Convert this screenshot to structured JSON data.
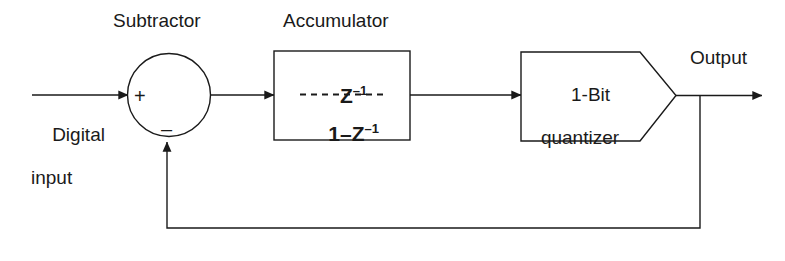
{
  "diagram": {
    "background_color": "#ffffff",
    "line_color": "#1a1a1a",
    "labels": {
      "subtractor": "Subtractor",
      "accumulator": "Accumulator",
      "digital_input_line1": "Digital",
      "digital_input_line2": "input",
      "output": "Output",
      "quantizer_line1": "1-Bit",
      "quantizer_line2": "quantizer",
      "plus_sign": "+",
      "minus_sign": "–"
    },
    "accumulator_transfer_function": {
      "numerator_base": "Z",
      "numerator_exponent": "–1",
      "denominator_base": "1–Z",
      "denominator_exponent": "–1",
      "fraction_bar_style": "dashed",
      "expression": "Z^-1 / (1 - Z^-1)"
    },
    "blocks": [
      {
        "name": "subtractor",
        "shape": "circle",
        "label": "Subtractor",
        "inputs": [
          "+",
          "–"
        ]
      },
      {
        "name": "accumulator",
        "shape": "rectangle",
        "label": "Accumulator",
        "content": "Z^-1 / (1 - Z^-1)"
      },
      {
        "name": "quantizer",
        "shape": "pentagon",
        "label": "1-Bit quantizer"
      }
    ],
    "signals": [
      {
        "name": "digital-input",
        "from": "external",
        "to": "subtractor"
      },
      {
        "name": "error",
        "from": "subtractor",
        "to": "accumulator"
      },
      {
        "name": "integrated",
        "from": "accumulator",
        "to": "quantizer"
      },
      {
        "name": "output",
        "from": "quantizer",
        "to": "external"
      },
      {
        "name": "feedback",
        "from": "quantizer-output-tap",
        "to": "subtractor-minus"
      }
    ]
  }
}
